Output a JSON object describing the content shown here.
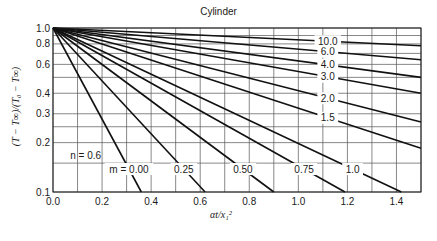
{
  "chart_data": {
    "type": "line",
    "title": "Cylinder",
    "xlabel": "αt/x₁²",
    "ylabel": "(T − T∞)/(T₀ − T∞)",
    "xlim": [
      0.0,
      1.5
    ],
    "ylim": [
      0.1,
      1.0
    ],
    "yscale": "log",
    "grid": true,
    "x_ticks": [
      0.0,
      0.2,
      0.4,
      0.6,
      0.8,
      1.0,
      1.2,
      1.4
    ],
    "x_tick_labels": [
      "0.0",
      "0.2",
      "0.4",
      "0.6",
      "0.8",
      "1.0",
      "1.2",
      "1.4"
    ],
    "y_ticks": [
      0.1,
      0.2,
      0.3,
      0.4,
      0.6,
      0.8,
      1.0
    ],
    "y_tick_labels": [
      "0.1",
      "0.2",
      "0.3",
      "0.4",
      "0.6",
      "0.8",
      "1.0"
    ],
    "y_gridlines": [
      0.1,
      0.15,
      0.2,
      0.25,
      0.3,
      0.4,
      0.5,
      0.6,
      0.7,
      0.8,
      0.9,
      1.0
    ],
    "annotations": [
      "n = 0.6"
    ],
    "series": [
      {
        "name": "m = 0.00",
        "label": "m = 0.00",
        "x": [
          0.0,
          0.36
        ],
        "y": [
          1.0,
          0.1
        ]
      },
      {
        "name": "m = 0.25",
        "label": "0.25",
        "x": [
          0.0,
          0.62
        ],
        "y": [
          1.0,
          0.1
        ]
      },
      {
        "name": "m = 0.50",
        "label": "0.50",
        "x": [
          0.0,
          0.9
        ],
        "y": [
          1.0,
          0.1
        ]
      },
      {
        "name": "m = 0.75",
        "label": "0.75",
        "x": [
          0.0,
          1.19
        ],
        "y": [
          1.0,
          0.1
        ]
      },
      {
        "name": "m = 1.0",
        "label": "1.0",
        "x": [
          0.0,
          1.42
        ],
        "y": [
          1.0,
          0.1
        ]
      },
      {
        "name": "m = 1.5",
        "label": "1.5",
        "x": [
          0.0,
          1.5
        ],
        "y": [
          1.0,
          0.185
        ]
      },
      {
        "name": "m = 2.0",
        "label": "2.0",
        "x": [
          0.0,
          1.5
        ],
        "y": [
          1.0,
          0.267
        ]
      },
      {
        "name": "m = 3.0",
        "label": "3.0",
        "x": [
          0.0,
          1.5
        ],
        "y": [
          1.0,
          0.4
        ]
      },
      {
        "name": "m = 4.0",
        "label": "4.0",
        "x": [
          0.0,
          1.5
        ],
        "y": [
          1.0,
          0.5
        ]
      },
      {
        "name": "m = 6.0",
        "label": "6.0",
        "x": [
          0.0,
          1.5
        ],
        "y": [
          1.0,
          0.64
        ]
      },
      {
        "name": "m = 10.0",
        "label": "10.0",
        "x": [
          0.0,
          1.5
        ],
        "y": [
          1.0,
          0.78
        ]
      }
    ]
  },
  "labels": {
    "title": "Cylinder",
    "xlabel": "αt/x₁²",
    "ylabel": "(T − T∞)/(T₀ − T∞)",
    "n_annotation": "n = 0.6"
  }
}
